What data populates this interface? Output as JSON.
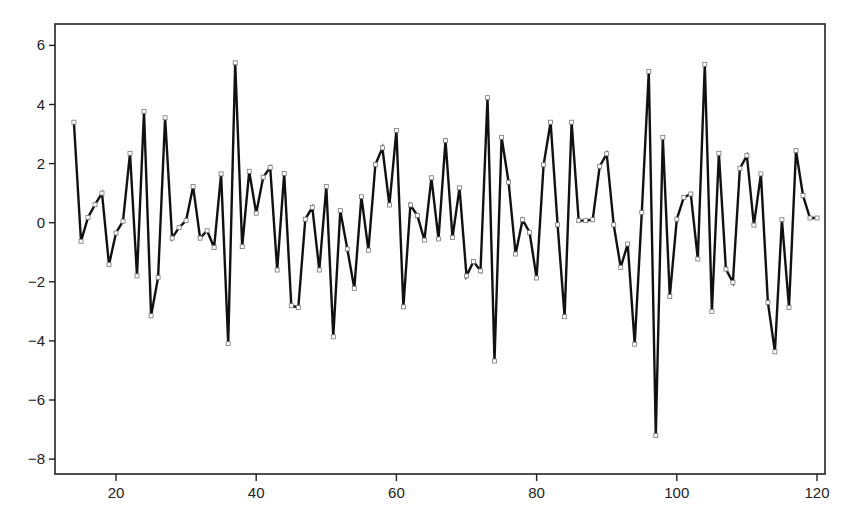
{
  "chart_data": {
    "type": "line",
    "title": "",
    "xlabel": "",
    "ylabel": "",
    "xlim": [
      12,
      122
    ],
    "ylim": [
      -8.6,
      6.6
    ],
    "grid": false,
    "legend": null,
    "marker": "open-square",
    "line_color": "#111111",
    "marker_fill": "#ffffff",
    "x_ticks": [
      20,
      40,
      60,
      80,
      100,
      120
    ],
    "x_tick_labels": [
      "20",
      "40",
      "60",
      "80",
      "100",
      "120"
    ],
    "y_ticks": [
      6,
      4,
      2,
      0,
      -2,
      -4,
      -6,
      -8
    ],
    "y_tick_labels": [
      "6",
      "4",
      "2",
      "0",
      "-2",
      "-4",
      "-6",
      "-8"
    ],
    "x_start": 14,
    "x_end": 120,
    "series": [
      {
        "name": "series",
        "values": [
          3.4,
          -0.63,
          0.18,
          0.61,
          1.0,
          -1.42,
          -0.35,
          0.05,
          2.35,
          -1.8,
          3.77,
          -3.15,
          -1.85,
          3.55,
          -0.52,
          -0.16,
          0.07,
          1.23,
          -0.52,
          -0.27,
          -0.84,
          1.65,
          -4.09,
          5.41,
          -0.81,
          1.74,
          0.32,
          1.54,
          1.87,
          -1.6,
          1.67,
          -2.81,
          -2.87,
          0.12,
          0.52,
          -1.6,
          1.23,
          -3.86,
          0.41,
          -0.89,
          -2.22,
          0.88,
          -0.93,
          1.97,
          2.53,
          0.6,
          3.12,
          -2.85,
          0.6,
          0.24,
          -0.59,
          1.52,
          -0.55,
          2.78,
          -0.5,
          1.18,
          -1.8,
          -1.31,
          -1.63,
          4.23,
          -4.68,
          2.89,
          1.37,
          -1.06,
          0.1,
          -0.33,
          -1.87,
          1.96,
          3.4,
          -0.07,
          -3.18,
          3.4,
          0.07,
          0.07,
          0.1,
          1.91,
          2.33,
          -0.07,
          -1.51,
          -0.72,
          -4.11,
          0.35,
          5.12,
          -7.2,
          2.89,
          -2.5,
          0.12,
          0.86,
          0.97,
          -1.23,
          5.36,
          -3.0,
          2.35,
          -1.57,
          -2.02,
          1.84,
          2.27,
          -0.08,
          1.65,
          -2.7,
          -4.37,
          0.1,
          -2.87,
          2.44,
          0.92,
          0.16,
          0.16
        ]
      }
    ]
  }
}
